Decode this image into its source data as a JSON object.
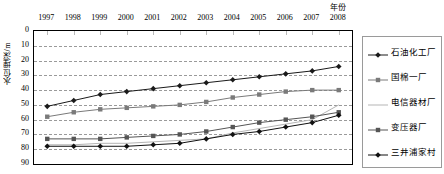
{
  "chart_data": {
    "type": "line",
    "title": "",
    "xlabel": "年份",
    "ylabel": "水位埋深/m",
    "x": [
      1997,
      1998,
      1999,
      2000,
      2001,
      2002,
      2003,
      2004,
      2005,
      2006,
      2007,
      2008
    ],
    "xtick_labels": [
      "1997",
      "1998",
      "1999",
      "2000",
      "2001",
      "2002",
      "2003",
      "2004",
      "2005",
      "2006",
      "2007",
      "2008"
    ],
    "ytick_labels": [
      "0",
      "10",
      "20",
      "30",
      "40",
      "50",
      "60",
      "70",
      "80",
      "90"
    ],
    "ylim": [
      0,
      90
    ],
    "y_inverted": true,
    "grid": true,
    "legend_position": "right",
    "series": [
      {
        "name": "石油化工厂",
        "marker": "diamond",
        "color": "#1a1a1a",
        "values": [
          51,
          47,
          43,
          41,
          39,
          37,
          35,
          33,
          31,
          29,
          27,
          24
        ]
      },
      {
        "name": "国棉一厂",
        "marker": "square",
        "color": "#7a7a7a",
        "values": [
          58,
          55,
          53,
          52,
          51,
          50,
          48,
          45,
          43,
          41,
          40,
          40
        ]
      },
      {
        "name": "电信器材厂",
        "marker": "none",
        "color": "#b5b5b5",
        "values": [
          77,
          77,
          76,
          76,
          75,
          74,
          73,
          69,
          66,
          63,
          60,
          50
        ]
      },
      {
        "name": "变压器厂",
        "marker": "square",
        "color": "#555555",
        "values": [
          73,
          73,
          73,
          72,
          71,
          70,
          68,
          65,
          62,
          60,
          58,
          55
        ]
      },
      {
        "name": "三井浦家村",
        "marker": "diamond",
        "color": "#111111",
        "values": [
          78,
          78,
          78,
          78,
          77,
          76,
          73,
          70,
          68,
          65,
          62,
          57
        ]
      }
    ]
  },
  "legend": {
    "items": [
      {
        "label": "石油化工厂"
      },
      {
        "label": "国棉一厂"
      },
      {
        "label": "电信器材厂"
      },
      {
        "label": "变压器厂"
      },
      {
        "label": "三井浦家村"
      }
    ]
  }
}
